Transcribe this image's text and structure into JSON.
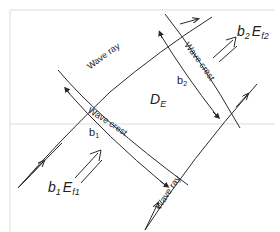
{
  "diagram": {
    "labels": {
      "wave_ray_top": "Wave ray",
      "wave_ray_right": "Wave ray",
      "wave_crest_left": "Wave crest",
      "wave_crest_right": "Wave crest",
      "region": "D",
      "region_sub": "E",
      "b1": "b",
      "b1_sub": "1",
      "b2": "b",
      "b2_sub": "2",
      "flux_in_b": "b",
      "flux_in_b_sub": "1",
      "flux_in_E": "E",
      "flux_in_E_sub": "f1",
      "flux_out_b": "b",
      "flux_out_b_sub": "2",
      "flux_out_E": "E",
      "flux_out_E_sub": "f2"
    },
    "colors": {
      "line": "#2a2a2a",
      "text": "#222222",
      "frame": "#dcdcdc",
      "background": "#ffffff"
    }
  }
}
